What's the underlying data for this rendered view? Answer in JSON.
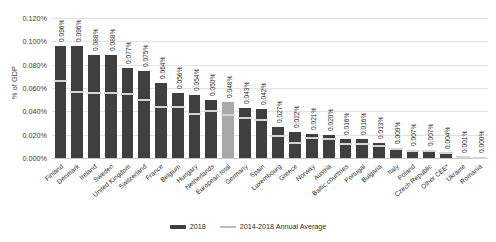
{
  "chart_data": {
    "type": "bar",
    "title": "",
    "xlabel": "",
    "ylabel": "% of GDP",
    "ylim": [
      0,
      0.0012
    ],
    "grid": true,
    "legend_position": "bottom",
    "value_suffix": "%",
    "yticks": [
      "0.000%",
      "0.020%",
      "0.040%",
      "0.060%",
      "0.080%",
      "0.100%",
      "0.120%"
    ],
    "ytick_values": [
      0.0,
      0.02,
      0.04,
      0.06,
      0.08,
      0.1,
      0.12
    ],
    "categories": [
      "Finland",
      "Denmark",
      "Ireland",
      "Sweden",
      "United Kingdom",
      "Switzerland",
      "France",
      "Belgium",
      "Hungary",
      "Netherlands",
      "European total",
      "Germany",
      "Spain",
      "Luxembourg",
      "Greece",
      "Norway",
      "Austria",
      "Baltic countries",
      "Portugal",
      "Bulgaria",
      "Italy",
      "Poland",
      "Czech Republic",
      "Other CEE*",
      "Ukraine",
      "Romania"
    ],
    "series": [
      {
        "name": "2018",
        "color": "#3f3f3f",
        "values": [
          0.096,
          0.096,
          0.088,
          0.088,
          0.077,
          0.075,
          0.064,
          0.056,
          0.054,
          0.05,
          0.048,
          0.043,
          0.042,
          0.027,
          0.022,
          0.021,
          0.02,
          0.016,
          0.016,
          0.013,
          0.009,
          0.007,
          0.007,
          0.004,
          0.001,
          0.0
        ],
        "labels": [
          "0.096%",
          "0.096%",
          "0.088%",
          "0.088%",
          "0.077%",
          "0.075%",
          "0.064%",
          "0.056%",
          "0.054%",
          "0.050%",
          "0.048%",
          "0.043%",
          "0.042%",
          "0.027%",
          "0.022%",
          "0.021%",
          "0.020%",
          "0.016%",
          "0.016%",
          "0.013%",
          "0.009%",
          "0.007%",
          "0.007%",
          "0.004%",
          "0.001%",
          "0.000%"
        ]
      },
      {
        "name": "2014-2018 Annual Average",
        "color": "#d4d4d4",
        "values": [
          0.066,
          0.057,
          0.056,
          0.056,
          0.055,
          0.05,
          0.044,
          0.044,
          0.038,
          0.04,
          0.037,
          0.034,
          0.033,
          0.019,
          0.013,
          0.017,
          0.016,
          0.012,
          0.012,
          0.01,
          0.008,
          0.006,
          0.006,
          0.004,
          0.001,
          0.0
        ]
      }
    ],
    "highlight_category": "European total",
    "highlight_color": "#a8a8a8"
  },
  "legend": {
    "items": [
      {
        "label": "2018"
      },
      {
        "label": "2014-2018 Annual Average"
      }
    ]
  }
}
